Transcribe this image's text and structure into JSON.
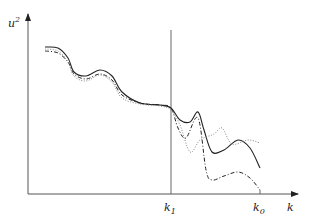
{
  "chart_data": {
    "type": "line",
    "title": "",
    "xlabel": "k",
    "ylabel": "u²",
    "ylabel_base": "u",
    "ylabel_sup": "2",
    "xlabel_text": "k",
    "grid": false,
    "legend": null,
    "ticks": [
      {
        "label_base": "k",
        "label_sub": "1",
        "x_px": 171
      },
      {
        "label_base": "k",
        "label_sub": "0",
        "x_px": 260
      }
    ],
    "annotations": [
      {
        "type": "vertical-line",
        "at": "k1",
        "description": "Vertical reference line at k1 separating smooth region from divergent region"
      }
    ],
    "series": [
      {
        "name": "solid",
        "style": "solid",
        "color": "#222222",
        "description": "Wavy decreasing curve; after k1 dips, peaks, drops sharply, rises to local max then falls near k0",
        "points_px": [
          [
            45,
            47
          ],
          [
            58,
            48
          ],
          [
            68,
            58
          ],
          [
            74,
            72
          ],
          [
            86,
            76
          ],
          [
            100,
            70
          ],
          [
            112,
            76
          ],
          [
            122,
            92
          ],
          [
            140,
            103
          ],
          [
            160,
            105
          ],
          [
            171,
            108
          ],
          [
            180,
            120
          ],
          [
            190,
            122
          ],
          [
            198,
            112
          ],
          [
            204,
            130
          ],
          [
            212,
            152
          ],
          [
            224,
            150
          ],
          [
            238,
            140
          ],
          [
            250,
            148
          ],
          [
            260,
            168
          ]
        ]
      },
      {
        "name": "dashed",
        "style": "dashed",
        "color": "#222222",
        "description": "Wavy decreasing curve; after k1 dips, peaks high, plunges to low level, small hump then falls to axis near k0",
        "points_px": [
          [
            45,
            51
          ],
          [
            58,
            53
          ],
          [
            68,
            62
          ],
          [
            74,
            74
          ],
          [
            86,
            79
          ],
          [
            100,
            74
          ],
          [
            112,
            80
          ],
          [
            122,
            95
          ],
          [
            140,
            103
          ],
          [
            160,
            105
          ],
          [
            171,
            108
          ],
          [
            178,
            128
          ],
          [
            186,
            138
          ],
          [
            198,
            118
          ],
          [
            206,
            170
          ],
          [
            212,
            180
          ],
          [
            224,
            176
          ],
          [
            238,
            172
          ],
          [
            250,
            178
          ],
          [
            260,
            190
          ]
        ]
      },
      {
        "name": "dotted",
        "style": "dotted",
        "color": "#888888",
        "description": "Wavy decreasing curve; after k1 dips low, peaks, then rises above others to plateau around high level",
        "points_px": [
          [
            45,
            49
          ],
          [
            58,
            51
          ],
          [
            68,
            62
          ],
          [
            74,
            76
          ],
          [
            86,
            81
          ],
          [
            100,
            75
          ],
          [
            112,
            82
          ],
          [
            122,
            98
          ],
          [
            140,
            104
          ],
          [
            160,
            106
          ],
          [
            171,
            110
          ],
          [
            180,
            125
          ],
          [
            190,
            152
          ],
          [
            200,
            140
          ],
          [
            214,
            134
          ],
          [
            222,
            128
          ],
          [
            232,
            144
          ],
          [
            248,
            140
          ],
          [
            260,
            143
          ]
        ]
      }
    ],
    "axes_px": {
      "origin": [
        28,
        194
      ],
      "y_top": 14,
      "x_right": 298,
      "k1_line_top": 30
    }
  }
}
